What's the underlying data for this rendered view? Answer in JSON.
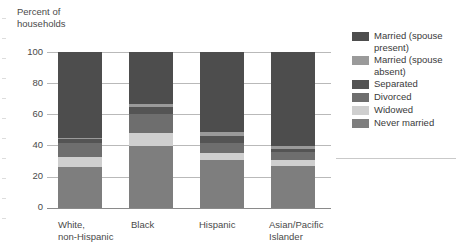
{
  "axis_title": "Percent of\nhouseholds",
  "y_axis": {
    "ticks": [
      "100",
      "80",
      "60",
      "40",
      "20",
      "0"
    ],
    "min": 0,
    "max": 100
  },
  "categories": [
    "White,\nnon-Hispanic",
    "Black",
    "Hispanic",
    "Asian/Pacific\nIslander"
  ],
  "legend": [
    {
      "label": "Married (spouse\npresent)",
      "color": "#4d4d4d"
    },
    {
      "label": "Married (spouse\nabsent)",
      "color": "#9a9a9a"
    },
    {
      "label": "Separated",
      "color": "#545454"
    },
    {
      "label": "Divorced",
      "color": "#6e6e6e"
    },
    {
      "label": "Widowed",
      "color": "#cfcfcf"
    },
    {
      "label": "Never married",
      "color": "#7e7e7e"
    }
  ],
  "chart_data": {
    "type": "bar",
    "subtype": "stacked-vertical-100",
    "title": "",
    "xlabel": "",
    "ylabel": "Percent of households",
    "ylim": [
      0,
      100
    ],
    "yticks": [
      0,
      20,
      40,
      60,
      80,
      100
    ],
    "grid": true,
    "legend_position": "right",
    "categories": [
      "White, non-Hispanic",
      "Black",
      "Hispanic",
      "Asian/Pacific Islander"
    ],
    "stack_order_bottom_to_top": [
      "Never married",
      "Widowed",
      "Divorced",
      "Separated",
      "Married (spouse absent)",
      "Married (spouse present)"
    ],
    "series": [
      {
        "name": "Married (spouse present)",
        "color": "#4d4d4d",
        "values": [
          55,
          33,
          51,
          60
        ]
      },
      {
        "name": "Married (spouse absent)",
        "color": "#9a9a9a",
        "values": [
          1,
          2,
          3,
          2
        ]
      },
      {
        "name": "Separated",
        "color": "#545454",
        "values": [
          2,
          5,
          4,
          2
        ]
      },
      {
        "name": "Divorced",
        "color": "#6e6e6e",
        "values": [
          9,
          12,
          7,
          5
        ]
      },
      {
        "name": "Widowed",
        "color": "#cfcfcf",
        "values": [
          7,
          8,
          4,
          4
        ]
      },
      {
        "name": "Never married",
        "color": "#7e7e7e",
        "values": [
          26,
          40,
          31,
          27
        ]
      }
    ]
  }
}
